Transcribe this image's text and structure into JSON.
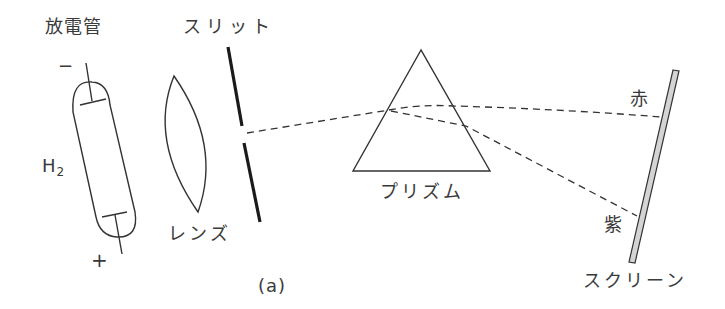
{
  "figure": {
    "caption": "(a)",
    "labels": {
      "discharge_tube": "放電管",
      "slit": "スリット",
      "lens": "レンズ",
      "prism": "プリズム",
      "screen": "スクリーン",
      "red": "赤",
      "violet": "紫",
      "gas": "H",
      "gas_subscript": "2",
      "minus": "−",
      "plus": "+"
    },
    "colors": {
      "line": "#333333",
      "screen_fill": "#d4d4d4"
    }
  }
}
